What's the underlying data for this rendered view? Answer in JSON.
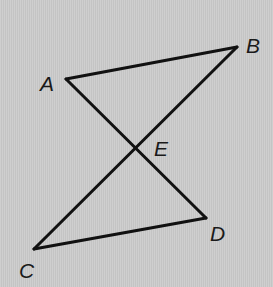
{
  "diagram": {
    "type": "geometry",
    "colors": {
      "background": "#cacaca",
      "line": "#111111",
      "label": "#1a1a1a"
    },
    "points": {
      "A": {
        "label": "A",
        "x": 66,
        "y": 79,
        "label_x": 40,
        "label_y": 91
      },
      "B": {
        "label": "B",
        "x": 237,
        "y": 47,
        "label_x": 246,
        "label_y": 53
      },
      "C": {
        "label": "C",
        "x": 34,
        "y": 249,
        "label_x": 19,
        "label_y": 278
      },
      "D": {
        "label": "D",
        "x": 206,
        "y": 218,
        "label_x": 210,
        "label_y": 241
      },
      "E": {
        "label": "E",
        "x": 136,
        "y": 149,
        "label_x": 154,
        "label_y": 156
      }
    },
    "segments": [
      {
        "name": "AB",
        "from": "A",
        "to": "B"
      },
      {
        "name": "BC",
        "from": "B",
        "to": "C"
      },
      {
        "name": "AD",
        "from": "A",
        "to": "D"
      },
      {
        "name": "CD",
        "from": "C",
        "to": "D"
      }
    ]
  }
}
